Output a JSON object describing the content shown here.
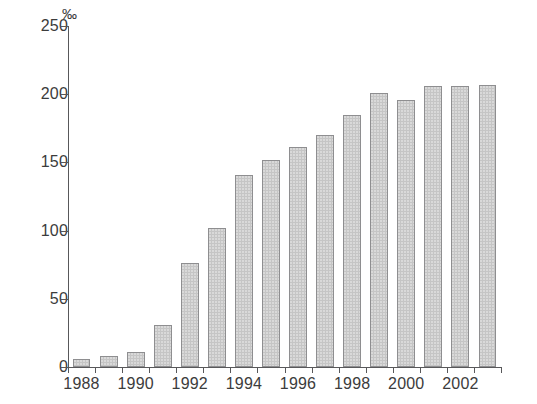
{
  "chart_data": {
    "type": "bar",
    "title": "",
    "subtitle": "",
    "xlabel": "",
    "ylabel": "",
    "unit_label": "‰",
    "categories": [
      "1988",
      "1989",
      "1990",
      "1991",
      "1992",
      "1993",
      "1994",
      "1995",
      "1996",
      "1997",
      "1998",
      "1999",
      "2000",
      "2001",
      "2002",
      "2003"
    ],
    "values": [
      6,
      8,
      11,
      31,
      76,
      102,
      141,
      152,
      161,
      170,
      185,
      201,
      196,
      206,
      206,
      207
    ],
    "series": [
      {
        "name": "",
        "values": [
          6,
          8,
          11,
          31,
          76,
          102,
          141,
          152,
          161,
          170,
          185,
          201,
          196,
          206,
          206,
          207
        ]
      }
    ],
    "ylim": [
      0,
      250
    ],
    "yticks": [
      0,
      50,
      100,
      150,
      200,
      250
    ],
    "ytick_labels": [
      "0",
      "50",
      "100",
      "150",
      "200",
      "250"
    ],
    "xtick_labels": [
      "1988",
      "1990",
      "1992",
      "1994",
      "1996",
      "1998",
      "2000",
      "2002"
    ],
    "xtick_categories": [
      "1988",
      "1990",
      "1992",
      "1994",
      "1996",
      "1998",
      "2000",
      "2002"
    ],
    "grid": false,
    "legend": null,
    "legend_position": "none",
    "annotations": [],
    "colors": {
      "bar_fill": "#c5c5c5",
      "bar_border": "#8e8e90",
      "axis": "#58585a",
      "text": "#3c3c3c",
      "background": "#ffffff"
    }
  }
}
